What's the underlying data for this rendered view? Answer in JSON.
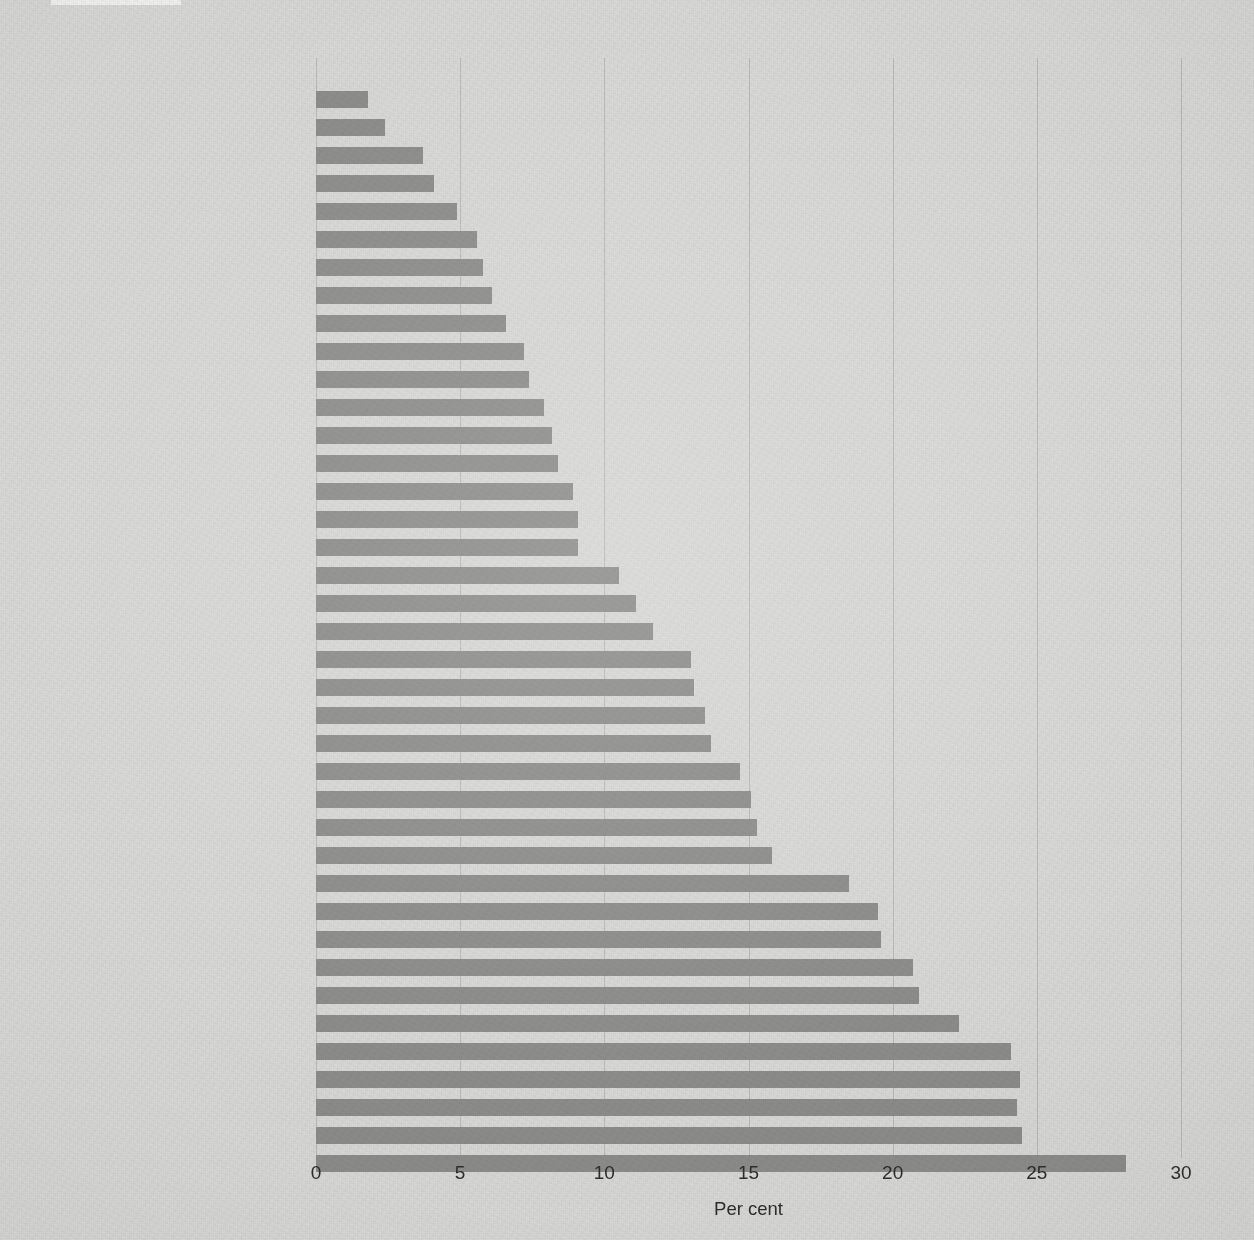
{
  "chart_data": {
    "type": "bar",
    "orientation": "horizontal",
    "title": "",
    "xlabel": "Per cent",
    "ylabel": "",
    "xlim": [
      0,
      30
    ],
    "xticks": [
      0,
      5,
      10,
      15,
      20,
      25,
      30
    ],
    "xtick_labels": [
      "0",
      "5",
      "10",
      "15",
      "20",
      "25",
      "30"
    ],
    "grid": "vertical-major",
    "legend": "none",
    "bar_color": "#8d8d8c",
    "background_color": "#d9d9d7",
    "categories": [
      "Timor-Leste",
      "Egypt",
      "Peru",
      "Ghana",
      "Jordan",
      "Bolivia",
      "Armenia",
      "Madagascar",
      "Malawi",
      "Albania",
      "Democratic Republic of the Congo",
      "Moldova",
      "Kenya",
      "Indonesia",
      "Nigeria",
      "Colombia",
      "Turkey",
      "Philippines",
      "Bangladesh",
      "Nicaragua",
      "Namibia",
      "Guyana",
      "Cambodia",
      "Turkmenistan",
      "Haiti",
      "United Republic of Tanzania",
      "Uganda",
      "Honduras",
      "Eswatini",
      "Morocco",
      "Zambia",
      "Nepal",
      "India",
      "Mozambique",
      "Zimbabwe",
      "Cameroon",
      "Myanmar",
      "Maldives",
      "Dominican Republic",
      "Lesotho"
    ],
    "values": [
      0.0,
      1.8,
      2.4,
      3.7,
      4.1,
      4.9,
      5.6,
      5.8,
      6.1,
      6.6,
      7.2,
      7.4,
      7.9,
      8.2,
      8.4,
      8.9,
      9.1,
      9.1,
      10.5,
      11.1,
      11.7,
      13.0,
      13.1,
      13.5,
      13.7,
      14.7,
      15.1,
      15.3,
      15.8,
      18.5,
      19.5,
      19.6,
      20.7,
      20.9,
      22.3,
      24.1,
      24.4,
      24.3,
      24.5,
      28.1
    ]
  }
}
